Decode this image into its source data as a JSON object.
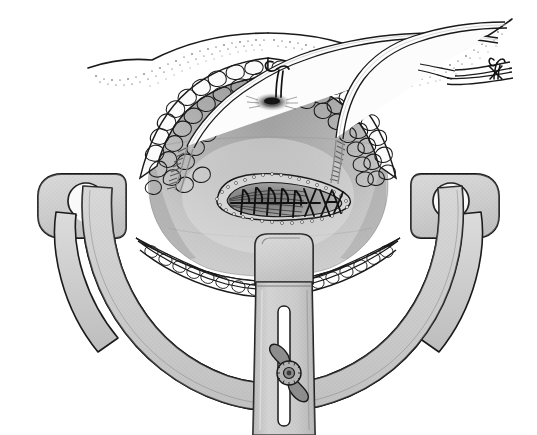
{
  "figure": {
    "domain_note": "line-art medical illustration, grayscale",
    "background_color": "#ffffff",
    "ink_color": "#1a1a1a"
  },
  "palette": {
    "ink": "#1a1a1a",
    "metal_light": "#d8d8d8",
    "metal_mid": "#c2c2c2",
    "metal_dark": "#9a9a9a",
    "metal_shadow": "#7d7d7d",
    "tissue_light": "#dcdcdc",
    "tissue_mid": "#b9b9b9",
    "tissue_dark": "#8e8e8e",
    "tissue_deep": "#6f6f6f",
    "fat_fill": "#fbfbfb",
    "tube_fill": "#fcfcfc",
    "wound_fill": "#a6a6a6",
    "wound_deep": "#5c5c5c",
    "white": "#ffffff"
  },
  "parts": {
    "skin_surface": {
      "name": "skin-surface",
      "label": "Skin surface with stippled dermis",
      "stipple_density": "medium"
    },
    "fat_layer_left": {
      "name": "subcutaneous-fat-left",
      "label": "Left subcutaneous fat layer (cobblestone lobules)",
      "lobule_count": 34
    },
    "fat_layer_right": {
      "name": "subcutaneous-fat-right",
      "label": "Right subcutaneous fat layer (cobblestone lobules)",
      "lobule_count": 32
    },
    "fat_layer_bottom": {
      "name": "subcutaneous-fat-bottom",
      "label": "Inferior subcutaneous fat layer",
      "lobule_count": 26
    },
    "wound_cavity": {
      "name": "wound-cavity",
      "label": "Exposed deep fascia / wound bed"
    },
    "closed_incision": {
      "name": "closed-incision",
      "label": "Closed incision with running and interrupted sutures",
      "running_suture_count": 5,
      "interrupted_x_stitch_count": 3,
      "shape": "teardrop / elongated oval"
    },
    "drain_tube_left": {
      "name": "drain-tube-left",
      "label": "Left drainage tube with fenestrated tip",
      "fenestration_count": 9
    },
    "drain_tube_right": {
      "name": "drain-tube-right",
      "label": "Right drainage tube with fenestrated tip",
      "fenestration_count": 9
    },
    "stab_wound": {
      "name": "stab-wound-exit",
      "label": "Tube exit stab wound in superior skin flap"
    },
    "anchor_suture_top": {
      "name": "anchor-suture-top",
      "label": "Anchor suture knot at superior skin edge"
    },
    "anchor_suture_exit": {
      "name": "anchor-suture-exit",
      "label": "Anchor suture knot securing tubes at skin exit site"
    },
    "retractor_blade_left": {
      "name": "retractor-blade-left",
      "label": "Left self-retaining retractor blade with keyhole"
    },
    "retractor_blade_right": {
      "name": "retractor-blade-right",
      "label": "Right self-retaining retractor blade with keyhole"
    },
    "retractor_blade_bottom": {
      "name": "retractor-blade-bottom",
      "label": "Inferior retractor blade"
    },
    "retractor_ring": {
      "name": "retractor-ring-band",
      "label": "Curved retractor ring / frame band"
    },
    "retractor_arm_center": {
      "name": "retractor-arm-center",
      "label": "Central retractor arm with slot"
    },
    "thumbscrew": {
      "name": "thumbscrew-wingnut",
      "label": "Knurled wing-nut thumbscrew locking the central arm",
      "wing_count": 2
    }
  }
}
